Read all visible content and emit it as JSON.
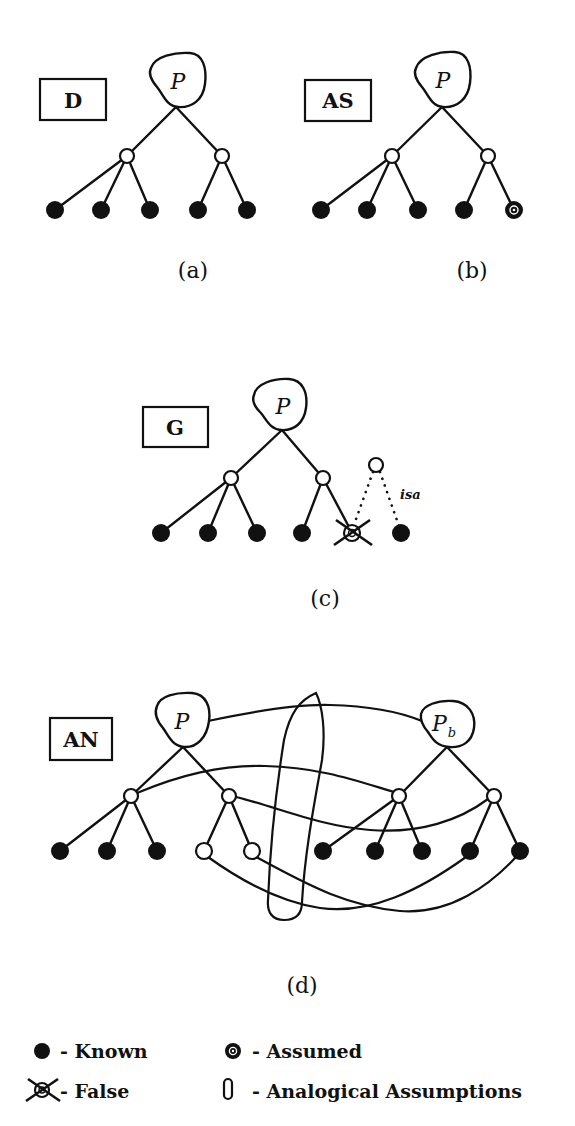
{
  "figure": {
    "panels": [
      {
        "id": "a",
        "tag": "D",
        "caption": "(a)",
        "root_label": "P"
      },
      {
        "id": "b",
        "tag": "AS",
        "caption": "(b)",
        "root_label": "P"
      },
      {
        "id": "c",
        "tag": "G",
        "caption": "(c)",
        "root_label": "P",
        "isa_label": "isa"
      },
      {
        "id": "d",
        "tag": "AN",
        "caption": "(d)",
        "root_label": "P",
        "base_label": "P",
        "base_subscript": "b"
      }
    ],
    "legend": [
      {
        "symbol": "filled-circle",
        "text": "- Known"
      },
      {
        "symbol": "assumed-circle",
        "text": "- Assumed"
      },
      {
        "symbol": "crossed-circle",
        "text": "- False"
      },
      {
        "symbol": "oval",
        "text": "- Analogical Assumptions"
      }
    ],
    "colors": {
      "ink": "#111111",
      "paper": "#ffffff"
    }
  }
}
